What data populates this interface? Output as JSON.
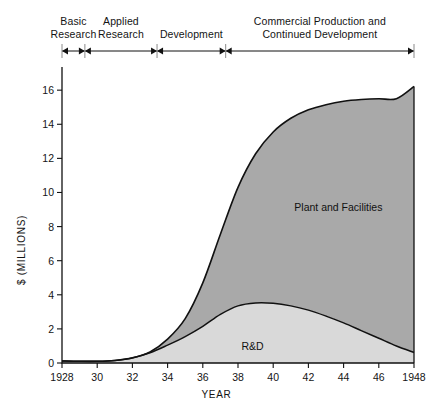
{
  "figure": {
    "phases": [
      {
        "id": "basic-research",
        "label": "Basic\nResearch",
        "start_year": 1928.0,
        "end_year": 1929.3
      },
      {
        "id": "applied-research",
        "label": "Applied\nResearch",
        "start_year": 1929.3,
        "end_year": 1933.4
      },
      {
        "id": "development",
        "label": "Development",
        "start_year": 1933.4,
        "end_year": 1937.3
      },
      {
        "id": "commercial",
        "label": "Commercial Production and\nContinued Development",
        "start_year": 1937.3,
        "end_year": 1948.0
      }
    ]
  },
  "chart_data": {
    "type": "area",
    "title": "",
    "xlabel": "YEAR",
    "ylabel": "$ (MILLIONS)",
    "xlim": [
      1928,
      1948
    ],
    "ylim": [
      0,
      17.3
    ],
    "grid": false,
    "stacked": true,
    "legend_position": "inline-annotation",
    "xticks": [
      1928,
      1930,
      1932,
      1934,
      1936,
      1938,
      1940,
      1942,
      1944,
      1946,
      1948
    ],
    "xticklabels": [
      "1928",
      "30",
      "32",
      "34",
      "36",
      "38",
      "40",
      "42",
      "44",
      "46",
      "1948"
    ],
    "yticks": [
      0,
      2,
      4,
      6,
      8,
      10,
      12,
      14,
      16
    ],
    "yticklabels": [
      "0",
      "2",
      "4",
      "6",
      "8",
      "10",
      "12",
      "14",
      "16"
    ],
    "x": [
      1928,
      1929,
      1930,
      1931,
      1932,
      1933,
      1934,
      1935,
      1936,
      1937,
      1938,
      1939,
      1940,
      1941,
      1942,
      1943,
      1944,
      1945,
      1946,
      1947,
      1948
    ],
    "series": [
      {
        "name": "R&D",
        "color": "#d9d9d9",
        "label_x": 1938.2,
        "label_y": 0.95,
        "values": [
          0.12,
          0.1,
          0.1,
          0.15,
          0.3,
          0.6,
          1.05,
          1.55,
          2.15,
          2.85,
          3.35,
          3.52,
          3.5,
          3.35,
          3.1,
          2.75,
          2.35,
          1.9,
          1.45,
          1.0,
          0.62
        ]
      },
      {
        "name": "Plant and Facilities",
        "color": "#a9a9a9",
        "label_x": 1941.2,
        "label_y": 9.1,
        "values": [
          0.0,
          0.0,
          0.0,
          0.0,
          0.0,
          0.05,
          0.35,
          1.05,
          2.55,
          4.7,
          6.95,
          8.75,
          10.05,
          11.0,
          11.75,
          12.4,
          13.0,
          13.55,
          14.05,
          14.5,
          15.6
        ]
      }
    ],
    "totals": [
      0.12,
      0.1,
      0.1,
      0.15,
      0.3,
      0.65,
      1.4,
      2.6,
      4.7,
      7.55,
      10.3,
      12.27,
      13.55,
      14.35,
      14.85,
      15.15,
      15.35,
      15.45,
      15.5,
      15.5,
      16.22
    ]
  }
}
